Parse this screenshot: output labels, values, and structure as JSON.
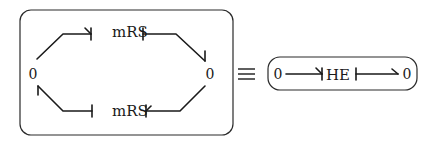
{
  "left_group": {
    "left_junction": "0",
    "right_junction": "0",
    "top_element": "mRS",
    "bottom_element": "mRS"
  },
  "equivalence_symbol": "≡",
  "right_group": {
    "left_junction": "0",
    "element": "HE",
    "right_junction": "0"
  },
  "colors": {
    "ink": "#1a1a1a",
    "background": "#ffffff"
  }
}
